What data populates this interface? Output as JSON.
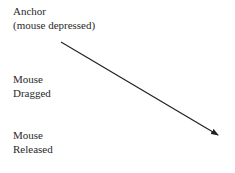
{
  "labels": {
    "anchor": {
      "line1": "Anchor",
      "line2": "(mouse depressed)"
    },
    "dragged": {
      "line1": "Mouse",
      "line2": "Dragged"
    },
    "released": {
      "line1": "Mouse",
      "line2": "Released"
    }
  },
  "arrow": {
    "x1": 61,
    "y1": 42,
    "x2": 218,
    "y2": 135,
    "color": "#222222"
  }
}
